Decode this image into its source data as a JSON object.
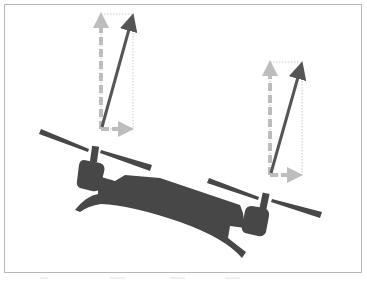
{
  "diagram": {
    "title": "",
    "colors": {
      "background": "#ffffff",
      "frame_border": "#b8b8b8",
      "drone_body": "#474747",
      "thrust_vector": "#555555",
      "component_vector": "#bdbdbd",
      "guide_box": "#c8c8c8"
    },
    "vectors": [
      {
        "name": "left-thrust",
        "origin": [
          101,
          129
        ],
        "tip": [
          133,
          14
        ],
        "vertical_component_tip": [
          101,
          14
        ],
        "horizontal_component_tip": [
          133,
          129
        ]
      },
      {
        "name": "right-thrust",
        "origin": [
          270,
          175
        ],
        "tip": [
          302,
          62
        ],
        "vertical_component_tip": [
          270,
          62
        ],
        "horizontal_component_tip": [
          302,
          175
        ]
      }
    ],
    "labels": []
  }
}
